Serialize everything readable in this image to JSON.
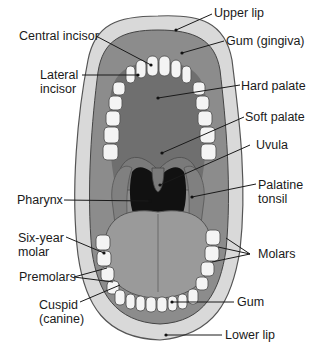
{
  "diagram": {
    "palette": {
      "background": "#ffffff",
      "lip": "#d9d9d9",
      "lip_outline": "#555555",
      "gum": "#8c8c8c",
      "palate": "#6f6f6f",
      "soft_palate": "#7a7a7a",
      "pharynx": "#111111",
      "tongue": "#9a9a9a",
      "teeth": "#f4f4f4",
      "leader_line": "#1a1a1a"
    },
    "labels": {
      "upper_lip": "Upper lip",
      "gum_gingiva": "Gum (gingiva)",
      "central_incisor": "Central incisor",
      "lateral_incisor": "Lateral\nincisor",
      "hard_palate": "Hard palate",
      "soft_palate": "Soft palate",
      "uvula": "Uvula",
      "pharynx": "Pharynx",
      "palatine_tonsil": "Palatine\ntonsil",
      "six_year_molar": "Six-year\nmolar",
      "molars": "Molars",
      "premolars": "Premolars",
      "cuspid_canine": "Cuspid\n(canine)",
      "gum": "Gum",
      "lower_lip": "Lower lip"
    }
  }
}
